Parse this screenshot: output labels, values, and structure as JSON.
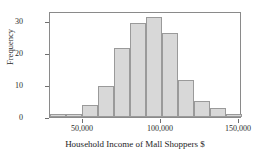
{
  "chart_data": {
    "type": "bar",
    "title": "",
    "xlabel": "Household Income of Mall Shoppers $",
    "ylabel": "Frequency",
    "categories": [
      "30,000",
      "40,000",
      "50,000",
      "60,000",
      "70,000",
      "80,000",
      "90,000",
      "100,000",
      "110,000",
      "120,000",
      "130,000",
      "140,000"
    ],
    "bin_edges": [
      30000,
      40000,
      50000,
      60000,
      70000,
      80000,
      90000,
      100000,
      110000,
      120000,
      130000,
      140000,
      150000
    ],
    "values": [
      1,
      1,
      4,
      10,
      22,
      30,
      32,
      27,
      12,
      5,
      3,
      1
    ],
    "bar_left_px": [
      0,
      16,
      32,
      48,
      64,
      80,
      96,
      112,
      128,
      144,
      160,
      176
    ],
    "bar_width_px": 16,
    "xlim": [
      25000,
      150000
    ],
    "ylim": [
      0,
      34
    ],
    "x_ticks": [
      50000,
      100000,
      150000
    ],
    "x_tick_labels": [
      "50,000",
      "100,000",
      "150,000"
    ],
    "x_tick_px": [
      82,
      160,
      238
    ],
    "y_ticks": [
      0,
      10,
      20,
      30
    ],
    "y_tick_labels": [
      "0",
      "10",
      "20",
      "30"
    ],
    "y_tick_px": [
      118,
      86,
      54,
      22
    ],
    "grid": false,
    "legend": "none",
    "bar_fill_color": "#d8d8d8",
    "bar_border_color": "#9a9a9a",
    "frame_color": "#8a8a8a",
    "text_color": "#2b2b2b"
  }
}
